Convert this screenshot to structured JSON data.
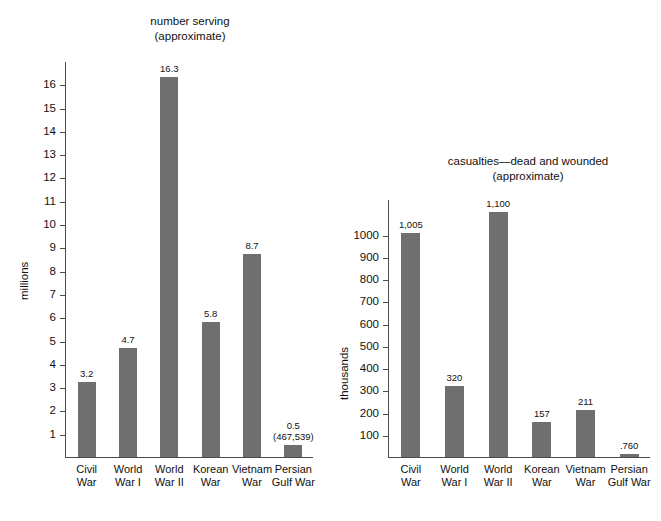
{
  "page": {
    "background_color": "#ffffff",
    "bar_color": "#6f6f6f",
    "axis_color": "#4a4a4a",
    "text_color": "#111111"
  },
  "chart_data": [
    {
      "id": "number-serving",
      "type": "bar",
      "title": "number serving",
      "subtitle": "(approximate)",
      "xlabel": "",
      "ylabel": "millions",
      "ylim": [
        0,
        17
      ],
      "ytick_step": 1,
      "yticks": [
        1,
        2,
        3,
        4,
        5,
        6,
        7,
        8,
        9,
        10,
        11,
        12,
        13,
        14,
        15,
        16
      ],
      "ytick_labels": [
        "1",
        "2",
        "3",
        "4",
        "5",
        "6",
        "7",
        "8",
        "9",
        "10",
        "11",
        "12",
        "13",
        "14",
        "15",
        "16"
      ],
      "grid": false,
      "legend": "none",
      "categories": [
        "Civil War",
        "World War I",
        "World War II",
        "Korean War",
        "Vietnam War",
        "Persian Gulf War"
      ],
      "category_lines": [
        [
          "Civil",
          "War"
        ],
        [
          "World",
          "War I"
        ],
        [
          "World",
          "War II"
        ],
        [
          "Korean",
          "War"
        ],
        [
          "Vietnam",
          "War"
        ],
        [
          "Persian",
          "Gulf War"
        ]
      ],
      "values": [
        3.2,
        4.7,
        16.3,
        5.8,
        8.7,
        0.5
      ],
      "value_labels": [
        "3.2",
        "4.7",
        "16.3",
        "5.8",
        "8.7",
        "0.5"
      ],
      "value_sublabels": [
        "",
        "",
        "",
        "",
        "",
        "(467,539)"
      ]
    },
    {
      "id": "casualties",
      "type": "bar",
      "title": "casualties—dead and wounded",
      "subtitle": "(approximate)",
      "xlabel": "",
      "ylabel": "thousands",
      "ylim": [
        0,
        1160
      ],
      "ytick_step": 100,
      "yticks": [
        100,
        200,
        300,
        400,
        500,
        600,
        700,
        800,
        900,
        1000
      ],
      "ytick_labels": [
        "100",
        "200",
        "300",
        "400",
        "500",
        "600",
        "700",
        "800",
        "900",
        "1000"
      ],
      "grid": false,
      "legend": "none",
      "categories": [
        "Civil War",
        "World War I",
        "World War II",
        "Korean War",
        "Vietnam War",
        "Persian Gulf War"
      ],
      "category_lines": [
        [
          "Civil",
          "War"
        ],
        [
          "World",
          "War I"
        ],
        [
          "World",
          "War II"
        ],
        [
          "Korean",
          "War"
        ],
        [
          "Vietnam",
          "War"
        ],
        [
          "Persian",
          "Gulf War"
        ]
      ],
      "values": [
        1005,
        320,
        1100,
        157,
        211,
        0.76
      ],
      "value_labels": [
        "1,005",
        "320",
        "1,100",
        "157",
        "211",
        ".760"
      ],
      "value_sublabels": [
        "",
        "",
        "",
        "",
        "",
        ""
      ]
    }
  ]
}
